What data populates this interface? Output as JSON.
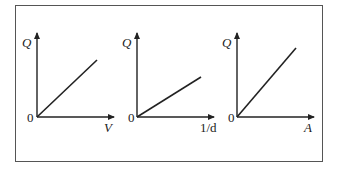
{
  "figure": {
    "panels": [
      {
        "y_label": "Q",
        "x_label": "V",
        "origin_label": "0",
        "slope": "medium"
      },
      {
        "y_label": "Q",
        "x_label": "1/d",
        "origin_label": "0",
        "slope": "low"
      },
      {
        "y_label": "Q",
        "x_label": "A",
        "origin_label": "0",
        "slope": "steep"
      }
    ]
  },
  "colors": {
    "line": "#222222",
    "frame": "#555555"
  }
}
